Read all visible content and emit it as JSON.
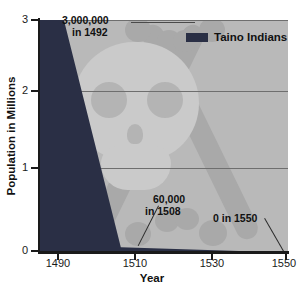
{
  "chart_data": {
    "type": "area",
    "title": "",
    "subtitle": "",
    "xlabel": "Year",
    "ylabel": "Population in Millions",
    "xlim": [
      1485,
      1555
    ],
    "ylim": [
      0,
      3
    ],
    "xticks": [
      "1490",
      "1510",
      "1530",
      "1550"
    ],
    "xtick_values": [
      1490,
      1510,
      1530,
      1550
    ],
    "yticks": [
      "0",
      "1",
      "2",
      "3"
    ],
    "ytick_values": [
      0,
      1,
      2,
      3
    ],
    "grid": "horizontal gridlines at y = 1, 2, 3",
    "legend_position": "top-right inside plot",
    "series": [
      {
        "name": "Taino Indians",
        "color": "#2a2f45",
        "x": [
          1492,
          1508,
          1550
        ],
        "values": [
          3.0,
          0.06,
          0.0
        ],
        "units": "millions"
      }
    ],
    "annotations": [
      {
        "id": "a1",
        "line1": "3,000,000",
        "line2": "in 1492",
        "points_to_x": 1492,
        "points_to_y": 3.0
      },
      {
        "id": "a2",
        "line1": "60,000",
        "line2": "in 1508",
        "points_to_x": 1508,
        "points_to_y": 0.06
      },
      {
        "id": "a3",
        "line1": "0 in 1550",
        "line2": "",
        "points_to_x": 1550,
        "points_to_y": 0.0
      }
    ],
    "background_watermark": "skull-and-crossbones"
  },
  "legend": {
    "entries": [
      {
        "label": "Taino Indians",
        "swatch_color": "#2a2f45"
      }
    ]
  },
  "axes": {
    "x_title": "Year",
    "y_title": "Population in Millions",
    "x_ticks": [
      {
        "label": "1490"
      },
      {
        "label": "1510"
      },
      {
        "label": "1530"
      },
      {
        "label": "1550"
      }
    ],
    "y_ticks": [
      {
        "label": "3"
      },
      {
        "label": "2"
      },
      {
        "label": "1"
      },
      {
        "label": "0"
      }
    ]
  },
  "annotations": {
    "peak": {
      "line1": "3,000,000",
      "line2": "in 1492"
    },
    "mid": {
      "line1": "60,000",
      "line2": "in 1508"
    },
    "end": {
      "line1": "0 in 1550",
      "line2": ""
    }
  },
  "colors": {
    "series": "#2a2f45",
    "plot_background": "#b9b9b9",
    "watermark": "#cacaca",
    "axis": "#1a1a1a",
    "gridline": "#6e6e6e"
  }
}
